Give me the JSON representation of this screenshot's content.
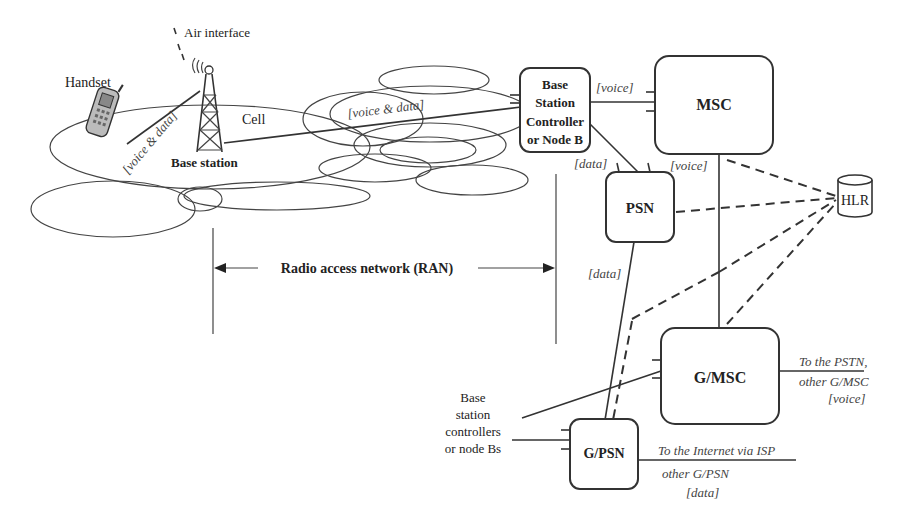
{
  "diagram": {
    "type": "cellular network architecture",
    "labels": {
      "air_interface": "Air interface",
      "handset": "Handset",
      "cell": "Cell",
      "base_station": "Base station",
      "handset_link": "[voice & data]",
      "bs_link": "[voice & data]",
      "ran": "Radio access network (RAN)"
    },
    "nodes": {
      "bsc": {
        "lines": [
          "Base",
          "Station",
          "Controller",
          "or Node B"
        ]
      },
      "msc": {
        "label": "MSC"
      },
      "psn": {
        "label": "PSN"
      },
      "hlr": {
        "label": "HLR"
      },
      "gmsc": {
        "label": "G/MSC"
      },
      "gpsn": {
        "label": "G/PSN"
      }
    },
    "edge_labels": {
      "bsc_msc": "[voice]",
      "bsc_psn": "[data]",
      "psn_msc": "[voice]",
      "psn_gpsn": "[data]"
    },
    "external": {
      "other_bscs": [
        "Base",
        "station",
        "controllers",
        "or node Bs"
      ],
      "pstn": [
        "To the PSTN,",
        "other G/MSC",
        "[voice]"
      ],
      "internet": [
        "To the Internet via ISP",
        "other G/PSN",
        "[data]"
      ]
    }
  }
}
